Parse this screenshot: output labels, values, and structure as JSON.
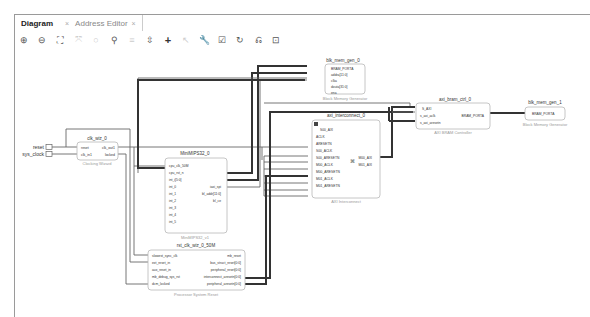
{
  "tabs": [
    {
      "label": "Diagram",
      "active": true,
      "close": "×"
    },
    {
      "label": "Address Editor",
      "active": false,
      "close": "×"
    }
  ],
  "toolbar": [
    {
      "name": "zoom-in-icon",
      "glyph": "⊕"
    },
    {
      "name": "zoom-out-icon",
      "glyph": "⊖"
    },
    {
      "name": "zoom-fit-icon",
      "glyph": "⛶"
    },
    {
      "name": "zoom-selection-icon",
      "glyph": "⤧"
    },
    {
      "name": "select-icon",
      "glyph": "○"
    },
    {
      "name": "search-icon",
      "glyph": "🔍"
    },
    {
      "name": "align-icon",
      "glyph": "≡"
    },
    {
      "name": "expand-icon",
      "glyph": "⇳"
    },
    {
      "name": "add-ip-icon",
      "glyph": "+"
    },
    {
      "name": "wire-icon",
      "glyph": "↖"
    },
    {
      "name": "settings-icon",
      "glyph": "⚙"
    },
    {
      "name": "validate-icon",
      "glyph": "☑"
    },
    {
      "name": "regenerate-icon",
      "glyph": "↻"
    },
    {
      "name": "optimize-icon",
      "glyph": "⎌"
    },
    {
      "name": "pin-icon",
      "glyph": "⊡"
    }
  ],
  "ports": {
    "reset": "reset",
    "sys_clock": "sys_clock"
  },
  "blocks": {
    "clk_wiz": {
      "name": "clk_wiz_0",
      "type": "Clocking Wizard",
      "inputs": [
        "reset",
        "clk_in1"
      ],
      "outputs": [
        "clk_out1",
        "locked"
      ]
    },
    "minimips": {
      "name": "MiniMIPS32_0",
      "type": "MiniMIPS32_v1",
      "inputs": [
        "cpu_clk_50M",
        "cpu_rst_n",
        "int_i[5:0]",
        "int_0",
        "int_1",
        "int_2",
        "int_3",
        "int_4",
        "int_5"
      ],
      "outputs": [
        "iaxi_spi",
        "bl_addr[11:0]",
        "bl_ce"
      ]
    },
    "rst": {
      "name": "rst_clk_wiz_0_50M",
      "type": "Processor System Reset",
      "inputs": [
        "slowest_sync_clk",
        "ext_reset_in",
        "aux_reset_in",
        "mb_debug_sys_rst",
        "dcm_locked"
      ],
      "outputs": [
        "mb_reset",
        "bus_struct_reset[0:0]",
        "peripheral_reset[0:0]",
        "interconnect_aresetn[0:0]",
        "peripheral_aresetn[0:0]"
      ]
    },
    "bram0": {
      "name": "blk_mem_gen_0",
      "type": "Block Memory Generator",
      "inputs": [
        "BRAM_PORTA",
        "addra[11:0]",
        "clka",
        "douta[31:0]",
        "ena"
      ]
    },
    "interconnect": {
      "name": "axi_interconnect_0",
      "type": "AXI Interconnect",
      "inputs": [
        "S00_AXI",
        "ACLK",
        "ARESETN",
        "S00_ACLK",
        "S00_ARESETN",
        "M00_ACLK",
        "M00_ARESETN",
        "M01_ACLK",
        "M01_ARESETN"
      ],
      "outputs": [
        "M00_AXI",
        "M01_AXI"
      ]
    },
    "bram_ctrl": {
      "name": "axi_bram_ctrl_0",
      "type": "AXI BRAM Controller",
      "inputs": [
        "S_AXI",
        "s_axi_aclk",
        "s_axi_aresetn"
      ],
      "outputs": [
        "BRAM_PORTA"
      ]
    },
    "bram1": {
      "name": "blk_mem_gen_1",
      "type": "Block Memory Generator",
      "inputs": [
        "BRAM_PORTA"
      ]
    }
  }
}
